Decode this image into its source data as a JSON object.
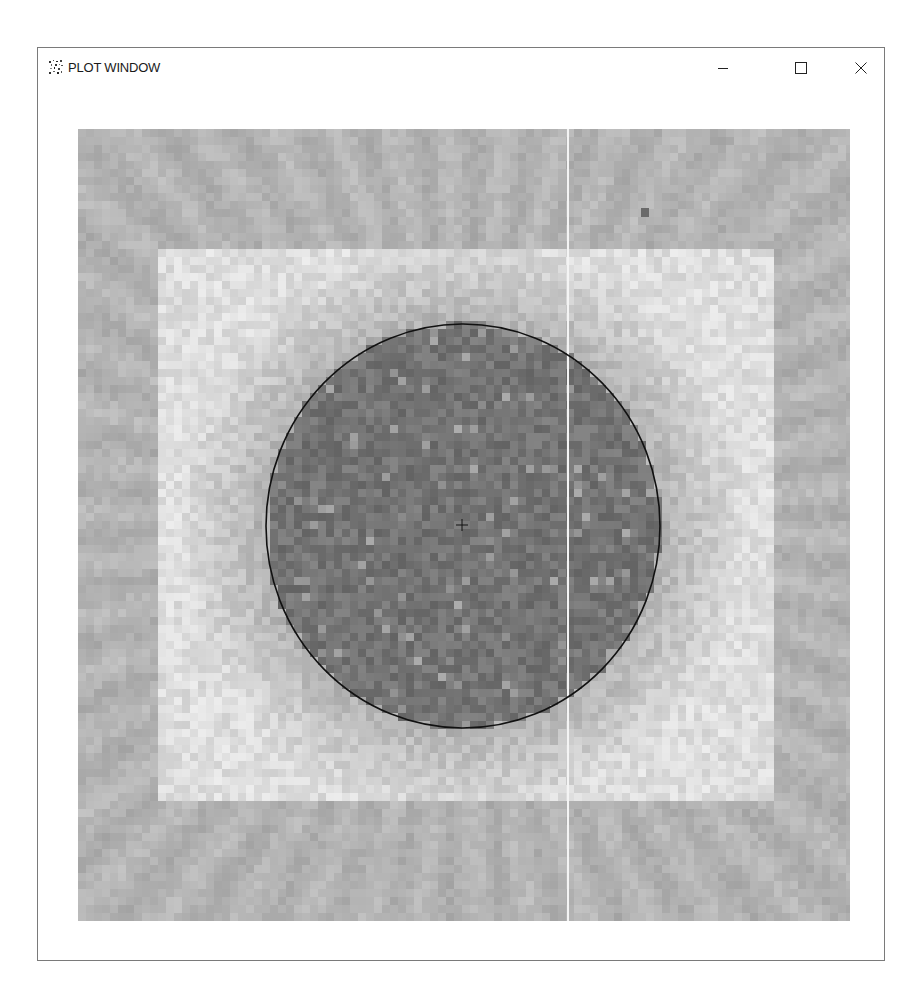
{
  "window": {
    "title": "PLOT WINDOW",
    "icon": "scatter-app-icon",
    "controls": {
      "minimize": {
        "icon": "minimize-icon",
        "glyph": "—"
      },
      "maximize": {
        "icon": "maximize-icon",
        "glyph": "☐"
      },
      "close": {
        "icon": "close-icon",
        "glyph": "✕"
      }
    }
  },
  "plot": {
    "width": 772,
    "height": 792,
    "cell_size": 8,
    "colors": {
      "outer_band": "#b3b3b3",
      "inner_square": "#dedede",
      "disk": "#747474",
      "circle_outline": "#111111",
      "crosshair": "#111111",
      "vertical_line": "#f4f4f4",
      "marker_square": "#6a6a6a"
    },
    "inner_square": {
      "x": 77,
      "y": 119,
      "w": 619,
      "h": 554
    },
    "circle": {
      "cx": 385,
      "cy": 397,
      "rx": 197,
      "ry": 202
    },
    "crosshair": {
      "x": 384,
      "y": 396,
      "size": 6
    },
    "vertical_line": {
      "x": 489
    },
    "marker_square": {
      "x": 563,
      "y": 79,
      "w": 8,
      "h": 9
    }
  }
}
